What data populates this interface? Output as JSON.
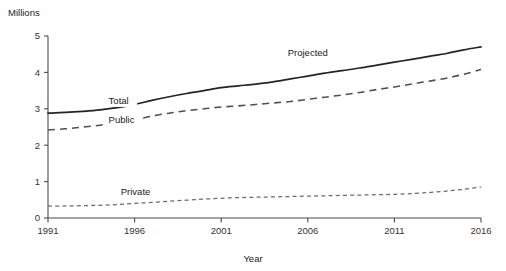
{
  "chart_data": {
    "type": "line",
    "title": "",
    "subtitle": "",
    "xlabel": "Year",
    "ylabel": "Millions",
    "unit_label": "Millions",
    "xlim": [
      1991,
      2016
    ],
    "ylim": [
      0,
      5
    ],
    "xticks": [
      1991,
      1996,
      2001,
      2006,
      2011,
      2016
    ],
    "xtick_labels": [
      "1991",
      "1996",
      "2001",
      "2006",
      "2011",
      "2016"
    ],
    "yticks": [
      0,
      1,
      2,
      3,
      4,
      5
    ],
    "ytick_labels": [
      "0",
      "1",
      "2",
      "3",
      "4",
      "5"
    ],
    "grid": false,
    "legend_position": "inline-series-labels",
    "x": [
      1991,
      1992,
      1993,
      1994,
      1995,
      1996,
      1997,
      1998,
      1999,
      2000,
      2001,
      2002,
      2003,
      2004,
      2005,
      2006,
      2007,
      2008,
      2009,
      2010,
      2011,
      2012,
      2013,
      2014,
      2015,
      2016
    ],
    "series": [
      {
        "name": "Total",
        "style": "solid",
        "label": "Total",
        "values": [
          2.88,
          2.9,
          2.93,
          2.97,
          3.03,
          3.12,
          3.23,
          3.33,
          3.42,
          3.5,
          3.58,
          3.63,
          3.68,
          3.74,
          3.82,
          3.9,
          3.98,
          4.05,
          4.12,
          4.2,
          4.28,
          4.36,
          4.44,
          4.52,
          4.62,
          4.7
        ]
      },
      {
        "name": "Public",
        "style": "dashed",
        "label": "Public",
        "values": [
          2.42,
          2.45,
          2.5,
          2.55,
          2.62,
          2.7,
          2.8,
          2.88,
          2.95,
          3.0,
          3.05,
          3.08,
          3.12,
          3.16,
          3.2,
          3.26,
          3.32,
          3.38,
          3.45,
          3.53,
          3.6,
          3.68,
          3.76,
          3.84,
          3.95,
          4.08
        ]
      },
      {
        "name": "Private",
        "style": "dotted",
        "label": "Private",
        "values": [
          0.33,
          0.33,
          0.34,
          0.35,
          0.37,
          0.4,
          0.43,
          0.46,
          0.49,
          0.52,
          0.54,
          0.56,
          0.57,
          0.58,
          0.59,
          0.6,
          0.61,
          0.62,
          0.63,
          0.64,
          0.65,
          0.67,
          0.7,
          0.74,
          0.79,
          0.85
        ]
      }
    ],
    "annotations": [
      {
        "text": "Projected",
        "x": 2006,
        "y": 4.45,
        "name": "projected-annotation"
      }
    ],
    "series_labels": [
      {
        "text": "Total",
        "x": 1994.5,
        "y": 3.12,
        "name": "total-series-label"
      },
      {
        "text": "Public",
        "x": 1994.5,
        "y": 2.62,
        "name": "public-series-label"
      },
      {
        "text": "Private",
        "x": 1995.2,
        "y": 0.62,
        "name": "private-series-label"
      }
    ],
    "colors": {
      "total": "#242424",
      "public": "#4f4f4f",
      "private": "#6a6a6a",
      "axis": "#4a4a4a",
      "text": "#1a1a1a",
      "background": "#ffffff"
    }
  }
}
